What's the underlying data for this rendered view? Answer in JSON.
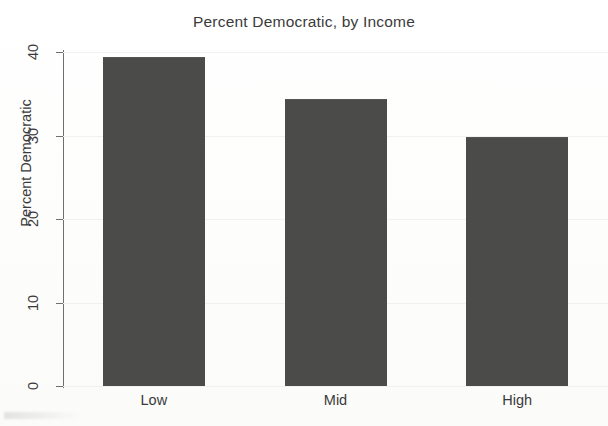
{
  "chart_data": {
    "type": "bar",
    "title": "Percent Democratic, by Income",
    "xlabel": "",
    "ylabel": "Percent Democratic",
    "categories": [
      "Low",
      "Mid",
      "High"
    ],
    "values": [
      39.4,
      34.4,
      29.8
    ],
    "ylim": [
      0,
      40
    ],
    "yticks": [
      0,
      10,
      20,
      30,
      40
    ],
    "ytick_labels": [
      "0",
      "10",
      "20",
      "30",
      "40"
    ],
    "grid": true,
    "grid_axis": "y",
    "legend": "none",
    "bar_color": "#4b4b49",
    "background_color": "#fefefe",
    "axis_color": "#6f6f6f",
    "gridline_color": "#f1f1f1",
    "text_color": "#3a3a3a"
  },
  "figure": {
    "title": "Percent Democratic, by Income"
  }
}
